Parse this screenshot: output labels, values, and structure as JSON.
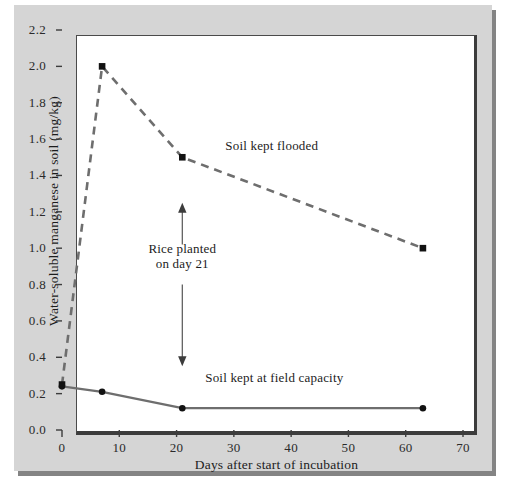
{
  "figure": {
    "background_color": "#d5d5d5",
    "plot_background_color": "#ffffff"
  },
  "chart_data": {
    "type": "line",
    "title": "",
    "xlabel": "Days after start of incubation",
    "ylabel": "Water-soluble manganese in soil (mg/kg)",
    "xlim": [
      0,
      70
    ],
    "ylim": [
      0.0,
      2.2
    ],
    "xticks": [
      0,
      10,
      20,
      30,
      40,
      50,
      60,
      70
    ],
    "xtick_labels": [
      "0",
      "10",
      "20",
      "30",
      "40",
      "50",
      "60",
      "70"
    ],
    "yticks": [
      0.0,
      0.2,
      0.4,
      0.6,
      0.8,
      1.0,
      1.2,
      1.4,
      1.6,
      1.8,
      2.0,
      2.2
    ],
    "ytick_labels": [
      "0.0",
      "0.2",
      "0.4",
      "0.6",
      "0.8",
      "1.0",
      "1.2",
      "1.4",
      "1.6",
      "1.8",
      "2.0",
      "2.2"
    ],
    "grid": false,
    "legend": "inline-annotations",
    "series": [
      {
        "name": "Soil kept flooded",
        "style": "dashed",
        "color": "#6e6e6e",
        "marker": "square",
        "marker_color": "#121212",
        "x": [
          0,
          7,
          21,
          63
        ],
        "values": [
          0.25,
          2.0,
          1.5,
          1.0
        ]
      },
      {
        "name": "Soil kept at field capacity",
        "style": "solid",
        "color": "#6e6e6e",
        "marker": "circle",
        "marker_color": "#121212",
        "x": [
          0,
          7,
          21,
          63
        ],
        "values": [
          0.24,
          0.21,
          0.12,
          0.12
        ]
      }
    ],
    "annotations": [
      {
        "id": "flooded-label",
        "text": "Soil kept flooded",
        "x": 28.5,
        "y": 1.565
      },
      {
        "id": "field-capacity-label",
        "text": "Soil kept at field capacity",
        "x": 25.0,
        "y": 0.29
      },
      {
        "id": "rice-planted-label",
        "line1": "Rice planted",
        "line2": "on day 21",
        "x": 21,
        "y_top": 1.25,
        "y_bottom": 0.35,
        "arrow": "double-headed-vertical"
      }
    ]
  }
}
